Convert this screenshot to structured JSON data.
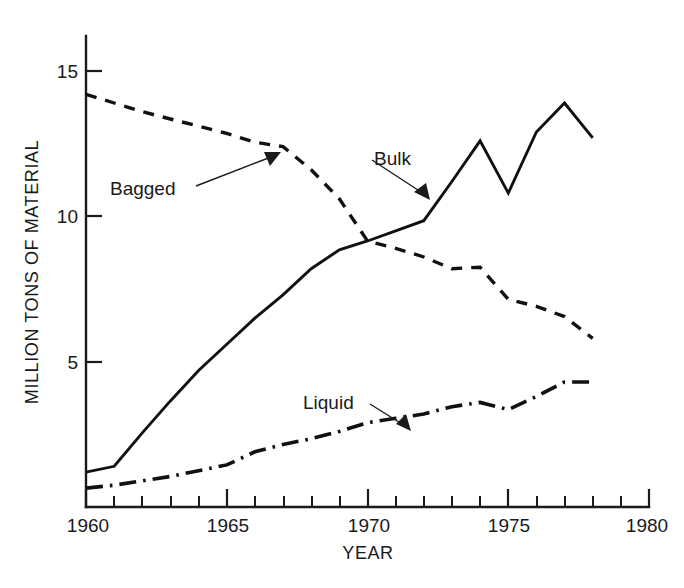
{
  "chart_data": {
    "type": "line",
    "title": "",
    "xlabel": "YEAR",
    "ylabel": "MILLION TONS OF MATERIAL",
    "xlim": [
      1960,
      1980
    ],
    "ylim": [
      0,
      15.8
    ],
    "grid": false,
    "legend": "inline-annotations",
    "x_ticks_major": [
      1960,
      1965,
      1970,
      1975,
      1980
    ],
    "x_tick_labels": [
      "1960",
      "1965",
      "1970",
      "1975",
      "1980"
    ],
    "x_tick_minor_step": 1,
    "y_ticks_major": [
      5,
      10,
      15
    ],
    "y_tick_labels": [
      "5",
      "10",
      "15"
    ],
    "x": [
      1960,
      1961,
      1962,
      1963,
      1964,
      1965,
      1966,
      1967,
      1968,
      1969,
      1970,
      1971,
      1972,
      1973,
      1974,
      1975,
      1976,
      1977,
      1978
    ],
    "series": [
      {
        "name": "Bagged",
        "style": "dashed",
        "color": "#111111",
        "annotation": "Bagged",
        "values": [
          14.2,
          13.9,
          13.6,
          13.35,
          13.1,
          12.85,
          12.55,
          12.4,
          11.6,
          10.6,
          9.15,
          8.9,
          8.6,
          8.2,
          8.25,
          7.15,
          6.9,
          6.55,
          5.8
        ]
      },
      {
        "name": "Bulk",
        "style": "solid",
        "color": "#111111",
        "annotation": "Bulk",
        "values": [
          1.2,
          1.4,
          2.55,
          3.65,
          4.7,
          5.6,
          6.5,
          7.3,
          8.2,
          8.85,
          9.15,
          9.5,
          9.85,
          11.2,
          12.6,
          10.8,
          12.9,
          13.9,
          12.7
        ]
      },
      {
        "name": "Liquid",
        "style": "dashdot",
        "color": "#111111",
        "annotation": "Liquid",
        "values": [
          0.65,
          0.75,
          0.9,
          1.05,
          1.25,
          1.45,
          1.9,
          2.15,
          2.35,
          2.6,
          2.9,
          3.05,
          3.2,
          3.45,
          3.6,
          3.35,
          3.8,
          4.3,
          4.3
        ]
      }
    ],
    "annotations": [
      {
        "label": "Bagged",
        "points_to_series": "Bagged",
        "points_to_x": 1967
      },
      {
        "label": "Bulk",
        "points_to_series": "Bulk",
        "points_to_x": 1972.4
      },
      {
        "label": "Liquid",
        "points_to_series": "Liquid",
        "points_to_x": 1970.6
      }
    ]
  },
  "axes": {
    "y_label": "MILLION TONS OF MATERIAL",
    "x_label": "YEAR",
    "y_tick_15": "15",
    "y_tick_10": "10",
    "y_tick_5": "5",
    "x_tick_1960": "1960",
    "x_tick_1965": "1965",
    "x_tick_1970": "1970",
    "x_tick_1975": "1975",
    "x_tick_1980": "1980"
  },
  "labels": {
    "bagged": "Bagged",
    "bulk": "Bulk",
    "liquid": "Liquid"
  },
  "colors": {
    "ink": "#111111",
    "background": "#ffffff"
  }
}
